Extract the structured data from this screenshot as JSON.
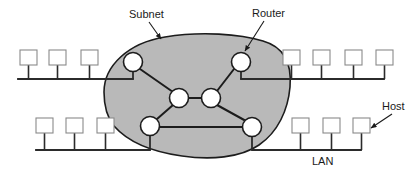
{
  "figure": {
    "background_color": "#ffffff"
  },
  "colors": {
    "subnet_fill": "#b9b9b9",
    "subnet_stroke": "#1c1c1c",
    "router_fill": "#ffffff",
    "router_stroke": "#1c1c1c",
    "host_fill": "#ffffff",
    "host_stroke": "#8a8a8a",
    "bus_line": "#2b2b2b",
    "link_line": "#1c1c1c",
    "text": "#1a1a1a"
  },
  "labels": {
    "subnet": "Subnet",
    "router": "Router",
    "host": "Host",
    "lan": "LAN"
  },
  "callouts": [
    {
      "name": "subnet-callout",
      "text": "Subnet",
      "text_x": 129,
      "text_y": 18,
      "anchor": "start",
      "arrow_from_x": 149,
      "arrow_from_y": 22,
      "arrow_to_x": 161,
      "arrow_to_y": 39
    },
    {
      "name": "router-callout",
      "text": "Router",
      "text_x": 252,
      "text_y": 17,
      "anchor": "start",
      "arrow_from_x": 264,
      "arrow_from_y": 21,
      "arrow_to_x": 245,
      "arrow_to_y": 51
    },
    {
      "name": "host-callout",
      "text": "Host",
      "text_x": 382,
      "text_y": 110,
      "anchor": "start",
      "arrow_from_x": 392,
      "arrow_from_y": 114,
      "arrow_to_x": 371,
      "arrow_to_y": 128
    },
    {
      "name": "lan-label",
      "text": "LAN",
      "text_x": 312,
      "text_y": 165,
      "anchor": "start",
      "arrow_from_x": null,
      "arrow_from_y": null,
      "arrow_to_x": null,
      "arrow_to_y": null
    }
  ],
  "subnet": {
    "name": "subnet-cloud",
    "shape_path": "M 104 92 C 104 66, 128 43, 165 37 C 201 31, 240 34, 263 41 C 284 47, 292 64, 290 87 C 288 110, 278 132, 259 145 C 240 158, 210 160, 182 156 C 153 152, 128 142, 114 126 C 106 116, 104 104, 104 92 Z"
  },
  "routers": [
    {
      "id": "router-top-left",
      "cx": 133,
      "cy": 62,
      "r": 9.5
    },
    {
      "id": "router-top-right",
      "cx": 241,
      "cy": 62,
      "r": 9.5
    },
    {
      "id": "router-mid-left",
      "cx": 179,
      "cy": 98,
      "r": 9.5
    },
    {
      "id": "router-mid-right",
      "cx": 211,
      "cy": 98,
      "r": 9.5
    },
    {
      "id": "router-bottom-left",
      "cx": 150,
      "cy": 126,
      "r": 9.5
    },
    {
      "id": "router-bottom-right",
      "cx": 252,
      "cy": 127,
      "r": 9.5
    }
  ],
  "router_links": [
    {
      "id": "link-tl-ml",
      "x1": 140,
      "y1": 69,
      "x2": 173,
      "y2": 92
    },
    {
      "id": "link-ml-mr",
      "x1": 189,
      "y1": 98,
      "x2": 201,
      "y2": 98
    },
    {
      "id": "link-tr-mr",
      "x1": 234,
      "y1": 69,
      "x2": 217,
      "y2": 91
    },
    {
      "id": "link-ml-bl",
      "x1": 173,
      "y1": 105,
      "x2": 157,
      "y2": 119
    },
    {
      "id": "link-mr-br",
      "x1": 217,
      "y1": 105,
      "x2": 246,
      "y2": 121
    },
    {
      "id": "link-bl-br",
      "x1": 160,
      "y1": 127,
      "x2": 243,
      "y2": 127
    }
  ],
  "lans": [
    {
      "id": "lan-top-left",
      "bus_y": 79,
      "bus_x1": 18,
      "bus_x2": 133,
      "host_stem_top": 65,
      "router_stem": {
        "x": 133,
        "from_y": 71,
        "to_y": 79
      },
      "hosts": [
        {
          "id": "host-tl-1",
          "x": 20,
          "y": 50,
          "w": 17,
          "h": 15
        },
        {
          "id": "host-tl-2",
          "x": 49,
          "y": 50,
          "w": 17,
          "h": 15
        },
        {
          "id": "host-tl-3",
          "x": 81,
          "y": 50,
          "w": 17,
          "h": 15
        }
      ]
    },
    {
      "id": "lan-top-right",
      "bus_y": 79,
      "bus_x1": 241,
      "bus_x2": 384,
      "host_stem_top": 65,
      "router_stem": {
        "x": 241,
        "from_y": 71,
        "to_y": 79
      },
      "hosts": [
        {
          "id": "host-tr-1",
          "x": 283,
          "y": 50,
          "w": 17,
          "h": 15
        },
        {
          "id": "host-tr-2",
          "x": 313,
          "y": 50,
          "w": 17,
          "h": 15
        },
        {
          "id": "host-tr-3",
          "x": 345,
          "y": 50,
          "w": 17,
          "h": 15
        },
        {
          "id": "host-tr-4",
          "x": 376,
          "y": 50,
          "w": 17,
          "h": 15
        }
      ]
    },
    {
      "id": "lan-bottom-left",
      "bus_y": 150,
      "bus_x1": 36,
      "bus_x2": 150,
      "host_stem_top": 133,
      "router_stem": {
        "x": 150,
        "from_y": 135,
        "to_y": 150
      },
      "hosts": [
        {
          "id": "host-bl-1",
          "x": 36,
          "y": 118,
          "w": 17,
          "h": 15
        },
        {
          "id": "host-bl-2",
          "x": 66,
          "y": 118,
          "w": 17,
          "h": 15
        },
        {
          "id": "host-bl-3",
          "x": 97,
          "y": 118,
          "w": 17,
          "h": 15
        }
      ]
    },
    {
      "id": "lan-bottom-right",
      "bus_y": 150,
      "bus_x1": 252,
      "bus_x2": 361,
      "host_stem_top": 133,
      "router_stem": {
        "x": 252,
        "from_y": 136,
        "to_y": 150
      },
      "hosts": [
        {
          "id": "host-br-1",
          "x": 292,
          "y": 118,
          "w": 17,
          "h": 15
        },
        {
          "id": "host-br-2",
          "x": 323,
          "y": 118,
          "w": 17,
          "h": 15
        },
        {
          "id": "host-br-3",
          "x": 353,
          "y": 118,
          "w": 17,
          "h": 15
        }
      ]
    }
  ]
}
